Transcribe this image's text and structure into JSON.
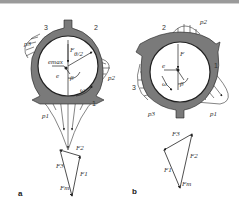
{
  "figure": {
    "panels": [
      {
        "id": "a",
        "label": "a",
        "lobe_numbers": [
          "1",
          "2",
          "3"
        ],
        "pressure_labels": [
          "p1",
          "p2",
          "p3"
        ],
        "force_label": "F",
        "angle_labels": [
          "β",
          "θ/2"
        ],
        "eccentricity_labels": [
          "e",
          "emax"
        ],
        "rotation_label": "ω",
        "polygon_labels": [
          "F1",
          "F2",
          "F3",
          "Fm"
        ]
      },
      {
        "id": "b",
        "label": "b",
        "lobe_numbers": [
          "1",
          "2",
          "3"
        ],
        "pressure_labels": [
          "p1",
          "p2",
          "p3"
        ],
        "force_label": "F",
        "angle_labels": [
          "β"
        ],
        "eccentricity_labels": [
          "e"
        ],
        "rotation_label": "ω",
        "polygon_labels": [
          "F1",
          "F2",
          "F3",
          "Fm"
        ]
      }
    ]
  },
  "colors": {
    "housing": "#7a7a7a",
    "line": "#222222",
    "hatch": "#333333"
  }
}
